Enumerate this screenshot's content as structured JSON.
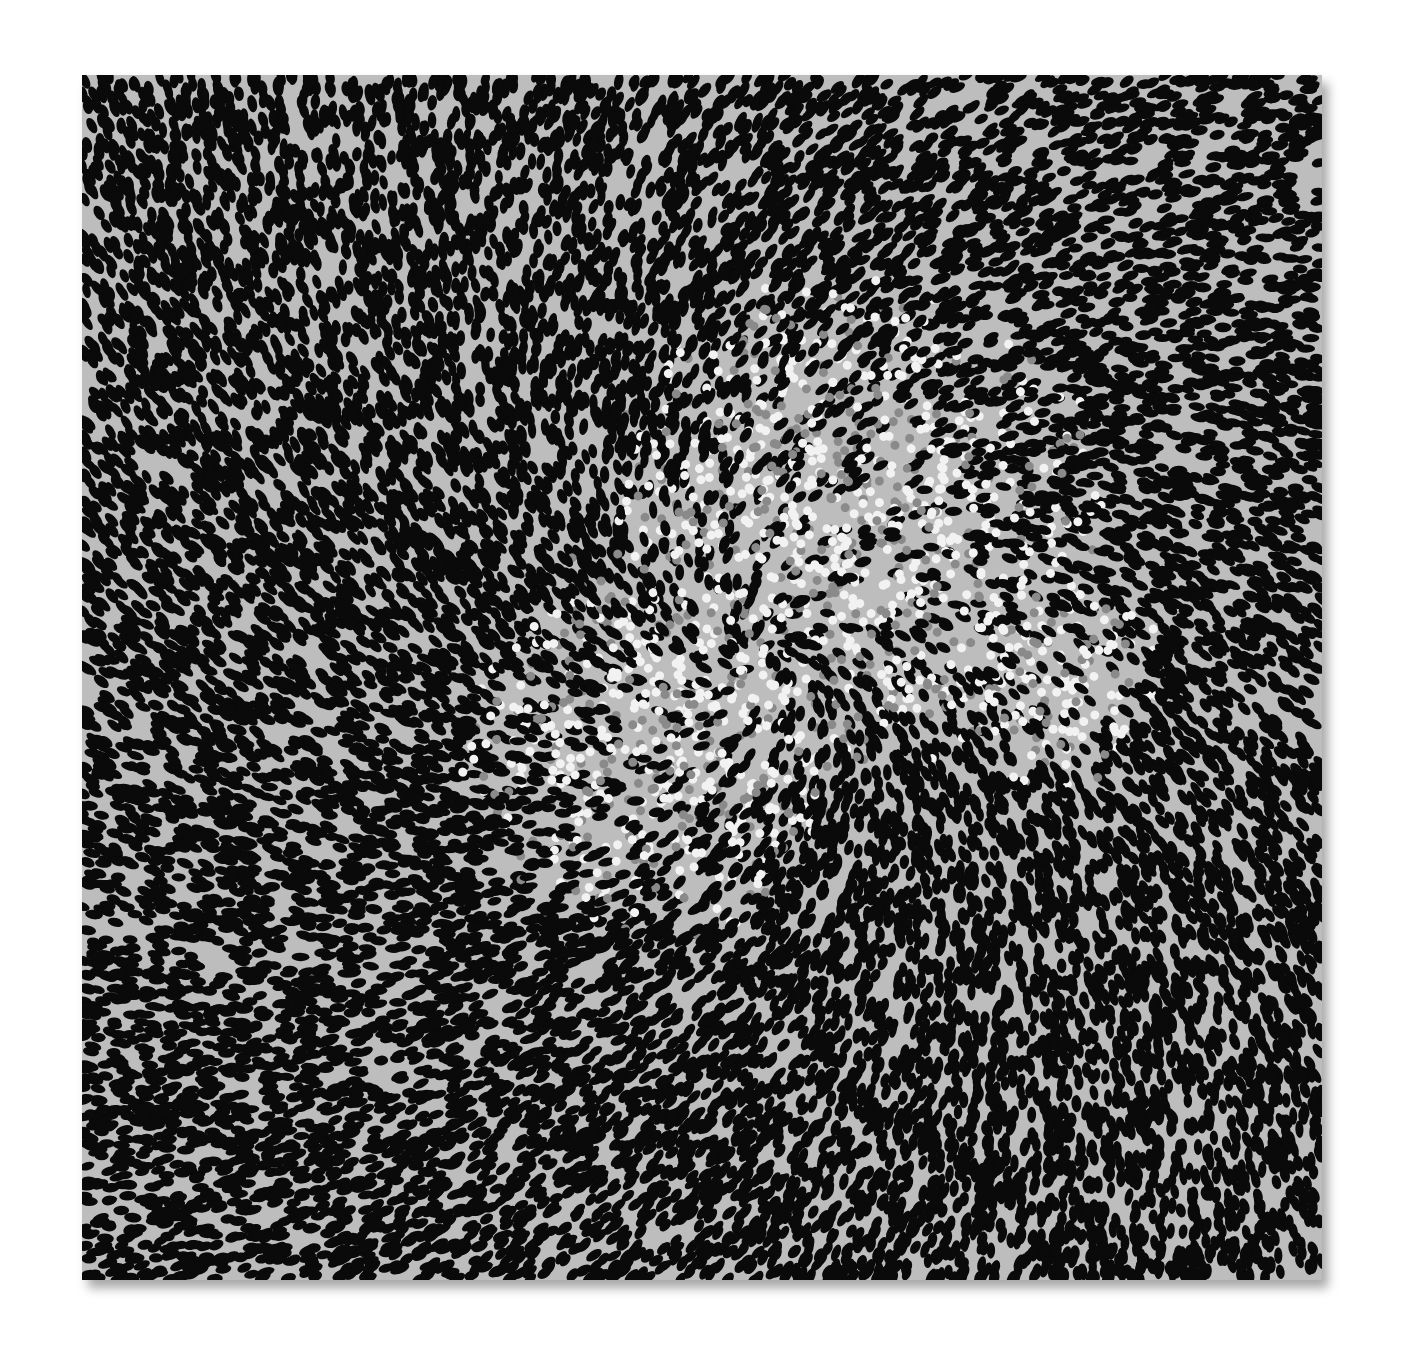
{
  "artwork": {
    "description": "Dotted black-and-white painting on square canvas with radial swirl and bright central clusters",
    "canvas": {
      "x": 82,
      "y": 75,
      "width": 1240,
      "height": 1205
    },
    "colors": {
      "background": "#ffffff",
      "ground": "#bdbdbd",
      "dot_dark": "#0a0a0a",
      "dot_light": "#f2f2f2",
      "dot_mid": "#8a8a8a"
    },
    "light_regions": [
      {
        "cx": 0.62,
        "cy": 0.38,
        "r": 0.22
      },
      {
        "cx": 0.47,
        "cy": 0.55,
        "r": 0.17
      },
      {
        "cx": 0.78,
        "cy": 0.5,
        "r": 0.1
      }
    ],
    "swirl_center": {
      "cx": 0.55,
      "cy": 0.48
    }
  }
}
